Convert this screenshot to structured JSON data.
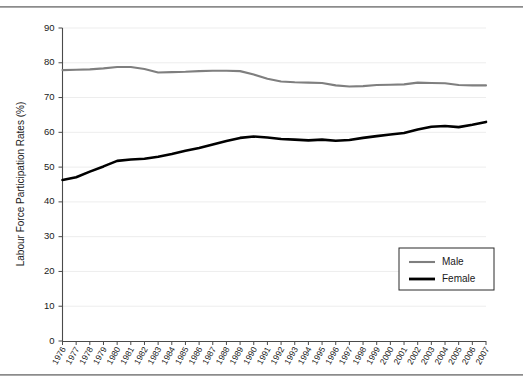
{
  "chart_data": {
    "type": "line",
    "title": "",
    "xlabel": "",
    "ylabel": "Labour Force Participation Rates (%)",
    "ylim": [
      0,
      90
    ],
    "ytick_step": 10,
    "yticks": [
      0,
      10,
      20,
      30,
      40,
      50,
      60,
      70,
      80,
      90
    ],
    "grid": true,
    "grid_axis": "y",
    "legend_position": "center-right",
    "categories": [
      "1976",
      "1977",
      "1978",
      "1979",
      "1980",
      "1981",
      "1982",
      "1983",
      "1984",
      "1985",
      "1986",
      "1987",
      "1988",
      "1989",
      "1990",
      "1991",
      "1992",
      "1993",
      "1994",
      "1995",
      "1996",
      "1997",
      "1998",
      "1999",
      "2000",
      "2001",
      "2002",
      "2003",
      "2004",
      "2005",
      "2006",
      "2007"
    ],
    "series": [
      {
        "name": "Male",
        "color": "#7f7f7f",
        "values": [
          77.9,
          78.0,
          78.1,
          78.4,
          78.8,
          78.8,
          78.2,
          77.2,
          77.3,
          77.4,
          77.6,
          77.7,
          77.7,
          77.6,
          76.6,
          75.4,
          74.6,
          74.4,
          74.3,
          74.2,
          73.5,
          73.2,
          73.3,
          73.6,
          73.7,
          73.8,
          74.3,
          74.2,
          74.1,
          73.6,
          73.5,
          73.5
        ]
      },
      {
        "name": "Female",
        "color": "#000000",
        "values": [
          46.3,
          47.1,
          48.7,
          50.2,
          51.8,
          52.2,
          52.4,
          53.0,
          53.8,
          54.7,
          55.5,
          56.5,
          57.5,
          58.4,
          58.8,
          58.5,
          58.1,
          57.9,
          57.7,
          57.9,
          57.6,
          57.8,
          58.4,
          58.9,
          59.4,
          59.8,
          60.8,
          61.6,
          61.8,
          61.5,
          62.2,
          63.0
        ]
      }
    ],
    "legend": [
      {
        "label": "Male",
        "color": "#7f7f7f"
      },
      {
        "label": "Female",
        "color": "#000000"
      }
    ]
  }
}
